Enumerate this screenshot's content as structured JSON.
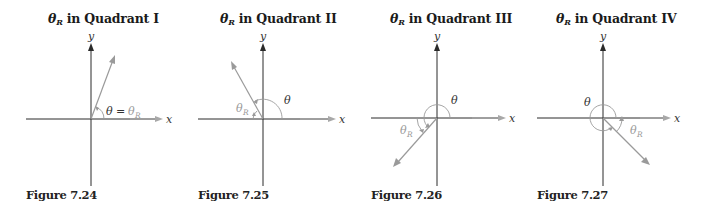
{
  "colors": {
    "axis": "#2a2a2a",
    "ray": "#9a9a9a",
    "xarrow": "#a8a8a8",
    "gray_label": "#9a9a9a",
    "text": "#1a1a1a"
  },
  "axis_labels": {
    "x": "x",
    "y": "y"
  },
  "symbols": {
    "theta": "θ",
    "ref_sub": "R",
    "equals": "="
  },
  "panels": [
    {
      "title_prefix": "θ",
      "title_sub": "R",
      "title_text": " in Quadrant I",
      "caption": "Figure 7.24",
      "quadrant": "I",
      "theta_label": "θ = θR"
    },
    {
      "title_prefix": "θ",
      "title_sub": "R",
      "title_text": " in Quadrant II",
      "caption": "Figure 7.25",
      "quadrant": "II",
      "theta_label": "θ",
      "ref_label": "θR"
    },
    {
      "title_prefix": "θ",
      "title_sub": "R",
      "title_text": " in Quadrant III",
      "caption": "Figure 7.26",
      "quadrant": "III",
      "theta_label": "θ",
      "ref_label": "θR"
    },
    {
      "title_prefix": "θ",
      "title_sub": "R",
      "title_text": " in Quadrant IV",
      "caption": "Figure 7.27",
      "quadrant": "IV",
      "theta_label": "θ",
      "ref_label": "θR"
    }
  ]
}
